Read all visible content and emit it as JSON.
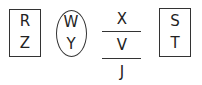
{
  "diagram": {
    "left_box": {
      "shape": "rectangle",
      "top": "R",
      "bottom": "Z"
    },
    "ellipse": {
      "shape": "ellipse",
      "top": "W",
      "bottom": "Y"
    },
    "fraction": {
      "shape": "stacked-with-lines",
      "top": "X",
      "middle": "V",
      "bottom": "J"
    },
    "right_box": {
      "shape": "rectangle",
      "top": "S",
      "bottom": "T"
    }
  }
}
